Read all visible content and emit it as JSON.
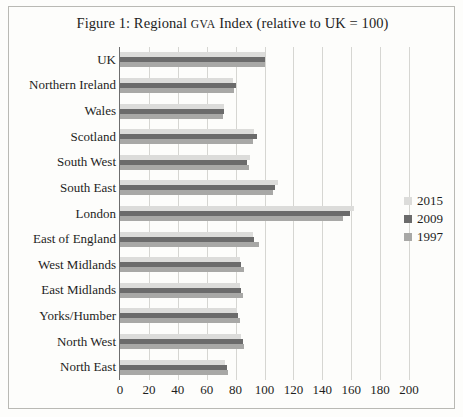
{
  "figure": {
    "title_prefix": "Figure 1: Regional ",
    "title_smallcaps": "GVA",
    "title_suffix": " Index (relative to UK = 100)"
  },
  "legend": {
    "position": "right",
    "entries": [
      {
        "label": "2015",
        "color": "#dcdcda"
      },
      {
        "label": "2009",
        "color": "#6b6b6b"
      },
      {
        "label": "1997",
        "color": "#a8a8a6"
      }
    ]
  },
  "chart_data": {
    "type": "bar",
    "orientation": "horizontal",
    "title": "Figure 1: Regional GVA Index (relative to UK = 100)",
    "xlabel": "",
    "ylabel": "",
    "xlim": [
      0,
      200
    ],
    "xticks": [
      "0",
      "20",
      "40",
      "60",
      "80",
      "100",
      "120",
      "140",
      "160",
      "180",
      "200"
    ],
    "grid": true,
    "grid_axis": "x",
    "legend_position": "right",
    "categories": [
      "UK",
      "Northern Ireland",
      "Wales",
      "Scotland",
      "South West",
      "South East",
      "London",
      "East of England",
      "West Midlands",
      "East Midlands",
      "Yorks/Humber",
      "North West",
      "North East"
    ],
    "series": [
      {
        "name": "2015",
        "color": "#dcdcda",
        "values": [
          100,
          78,
          72,
          93,
          90,
          109,
          162,
          92,
          83,
          83,
          81,
          84,
          73
        ]
      },
      {
        "name": "2009",
        "color": "#6b6b6b",
        "values": [
          100,
          80,
          72,
          95,
          88,
          107,
          159,
          93,
          84,
          84,
          82,
          85,
          74
        ]
      },
      {
        "name": "1997",
        "color": "#a8a8a6",
        "values": [
          100,
          79,
          71,
          92,
          89,
          106,
          154,
          96,
          86,
          85,
          83,
          86,
          75
        ]
      }
    ]
  }
}
